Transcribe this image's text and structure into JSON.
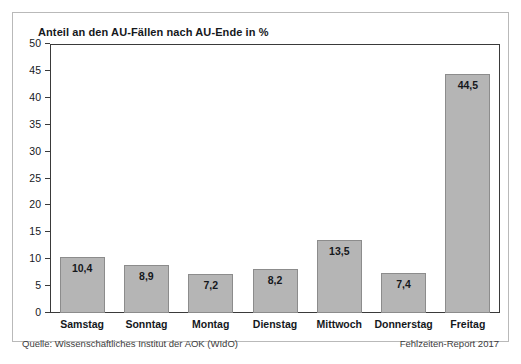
{
  "chart_data": {
    "type": "bar",
    "title": "Anteil an den AU-Fällen nach AU-Ende in %",
    "xlabel": "",
    "ylabel": "",
    "ylim": [
      0,
      50
    ],
    "yticks": [
      0,
      5,
      10,
      15,
      20,
      25,
      30,
      35,
      40,
      45,
      50
    ],
    "ytick_labels": [
      "0",
      "5",
      "10",
      "15",
      "20",
      "25",
      "30",
      "35",
      "40",
      "45",
      "50"
    ],
    "grid": false,
    "legend": false,
    "categories": [
      "Samstag",
      "Sonntag",
      "Montag",
      "Dienstag",
      "Mittwoch",
      "Donnerstag",
      "Freitag"
    ],
    "values": [
      10.4,
      8.9,
      7.2,
      8.2,
      13.5,
      7.4,
      44.5
    ],
    "value_labels": [
      "10,4",
      "8,9",
      "7,2",
      "8,2",
      "13,5",
      "7,4",
      "44,5"
    ],
    "bar_color": "#b5b5b5",
    "bar_edge_color": "#8c8c8c"
  },
  "footer": {
    "source": "Quelle: Wissenschaftliches Institut der AOK (WIdO)",
    "report": "Fehlzeiten-Report 2017"
  }
}
